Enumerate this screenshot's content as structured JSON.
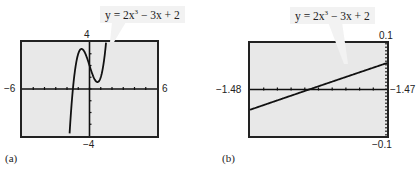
{
  "chart_data": [
    {
      "type": "line",
      "panel": "(a)",
      "title": "y = 2x^3 - 3x + 2",
      "equation": {
        "prefix": "y = 2x",
        "exp": "3",
        "suffix": " − 3x + 2"
      },
      "xlim": [
        -6,
        6
      ],
      "ylim": [
        -4,
        4
      ],
      "xscale_ticks": 1,
      "yscale_ticks": 1,
      "tick_labels": {
        "left": "−6",
        "right": "6",
        "top": "4",
        "bottom": "−4"
      },
      "grid": false,
      "series": [
        {
          "name": "y = 2x^3 - 3x + 2",
          "function": "2*x^3 - 3*x + 2"
        }
      ]
    },
    {
      "type": "line",
      "panel": "(b)",
      "title": "y = 2x^3 - 3x + 2",
      "equation": {
        "prefix": "y = 2x",
        "exp": "3",
        "suffix": " − 3x + 2"
      },
      "xlim": [
        -1.48,
        -1.47
      ],
      "ylim": [
        -0.1,
        0.1
      ],
      "tick_labels": {
        "left": "−1.48",
        "right": "−1.47",
        "top": "0.1",
        "bottom": "−0.1"
      },
      "grid": false,
      "series": [
        {
          "name": "y = 2x^3 - 3x + 2",
          "function": "2*x^3 - 3*x + 2"
        }
      ],
      "annotation": "zoom near root x ≈ -1.4757"
    }
  ],
  "captions": {
    "a": "(a)",
    "b": "(b)"
  }
}
